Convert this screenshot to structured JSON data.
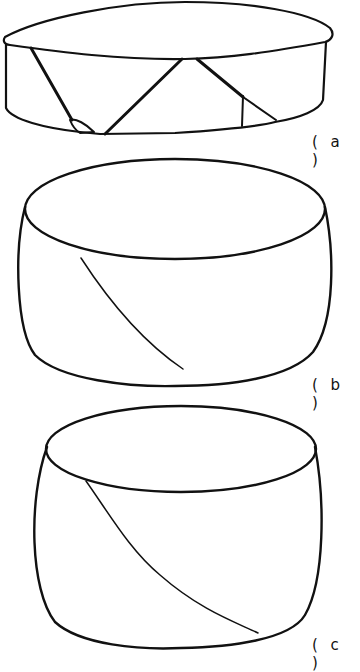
{
  "figure": {
    "panels": [
      {
        "id": "a",
        "label": "( a )",
        "description": "Flat cylindrical specimen with multiple conjugate shear fracture lines"
      },
      {
        "id": "b",
        "label": "( b )",
        "description": "Barrelled cylindrical specimen with a single inclined crack on the side"
      },
      {
        "id": "c",
        "label": "( c )",
        "description": "Barrelled cylindrical specimen with inclined crack running from top rim to bottom rim"
      }
    ],
    "colors": {
      "line": "#111111",
      "background": "#ffffff"
    }
  }
}
